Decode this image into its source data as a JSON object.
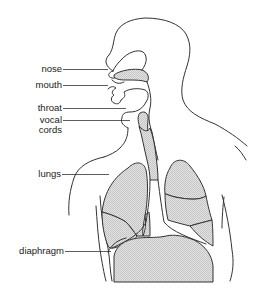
{
  "diagram": {
    "labels": [
      {
        "id": "nose",
        "text": "nose"
      },
      {
        "id": "mouth",
        "text": "mouth"
      },
      {
        "id": "throat",
        "text": "throat"
      },
      {
        "id": "vocal_cords",
        "line1": "vocal",
        "line2": "cords"
      },
      {
        "id": "lungs",
        "text": "lungs"
      },
      {
        "id": "diaphragm",
        "text": "diaphragm"
      }
    ],
    "colors": {
      "line": "#333333",
      "organ_fill": "#d9d9d9",
      "background": "#ffffff"
    }
  }
}
